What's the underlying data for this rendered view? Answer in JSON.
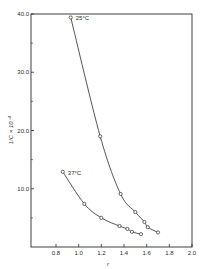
{
  "chart_data": {
    "type": "line",
    "title": "",
    "xlabel": "r",
    "ylabel": "1/C × 10⁻⁴",
    "xlim": [
      0.6,
      2.0
    ],
    "ylim": [
      0,
      40
    ],
    "x_ticks": [
      0.8,
      1.0,
      1.2,
      1.4,
      1.6,
      1.8,
      2.0
    ],
    "x_tick_labels": [
      "0.8",
      "1.0",
      "1.2",
      "1.4",
      "1.6",
      "1.8",
      "2.0"
    ],
    "y_ticks": [
      10,
      20,
      30,
      40
    ],
    "y_tick_labels": [
      "10.0",
      "20.0",
      "30.0",
      "40.0"
    ],
    "y_minor_ticks": [
      5,
      15,
      25,
      35
    ],
    "grid": false,
    "legend": "inline labels near curve start",
    "series": [
      {
        "name": "25°C",
        "marker": "open-circle",
        "x": [
          0.93,
          1.19,
          1.37,
          1.5,
          1.58,
          1.61,
          1.7
        ],
        "y": [
          39.4,
          19.0,
          9.1,
          6.0,
          4.3,
          3.4,
          2.5
        ]
      },
      {
        "name": "37°C",
        "marker": "open-circle",
        "x": [
          0.86,
          1.05,
          1.2,
          1.36,
          1.43,
          1.47,
          1.55
        ],
        "y": [
          12.9,
          7.4,
          5.0,
          3.6,
          3.1,
          2.6,
          2.2
        ]
      }
    ]
  },
  "colors": {
    "ink": "#2a2a2a",
    "background": "#ffffff"
  }
}
